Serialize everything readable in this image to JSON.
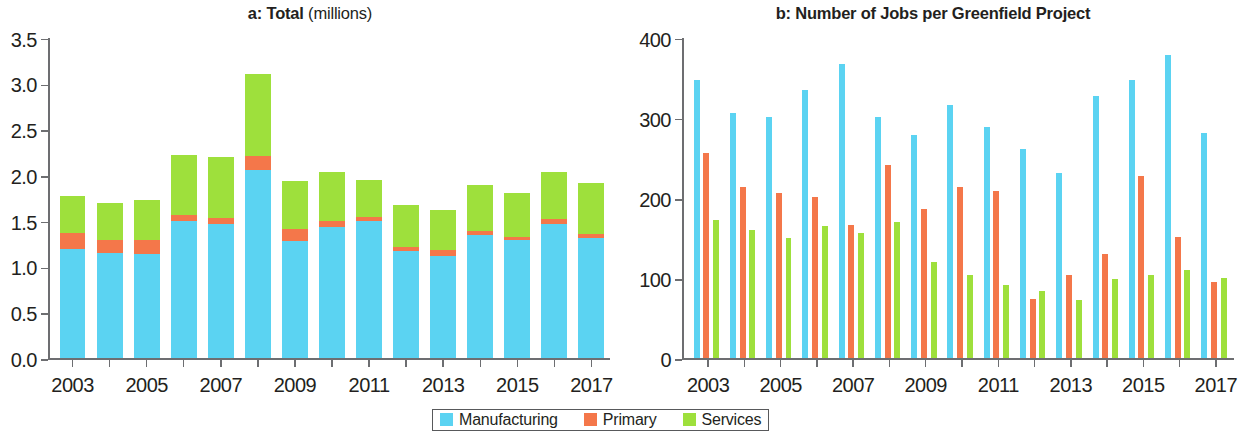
{
  "legend": {
    "entries": [
      {
        "label": "Manufacturing",
        "color": "#5BD3F2"
      },
      {
        "label": "Primary",
        "color": "#F4774A"
      },
      {
        "label": "Services",
        "color": "#9EE03C"
      }
    ]
  },
  "colors": {
    "manufacturing": "#5BD3F2",
    "primary": "#F4774A",
    "services": "#9EE03C",
    "axis": "#6D6E71",
    "text": "#231F20"
  },
  "panel_a": {
    "title_bold": "a: Total",
    "title_regular": "(millions)"
  },
  "panel_b": {
    "title_bold": "b: Number of Jobs per Greenfield Project",
    "title_regular": ""
  },
  "chart_data": [
    {
      "id": "panel-a",
      "type": "bar",
      "stacked": true,
      "title": "a: Total (millions)",
      "xlabel": "",
      "ylabel": "",
      "ylim": [
        0,
        3.5
      ],
      "yticks": [
        0,
        0.5,
        1.0,
        1.5,
        2.0,
        2.5,
        3.0,
        3.5
      ],
      "ytick_labels": [
        "0.0",
        "0.5",
        "1.0",
        "1.5",
        "2.0",
        "2.5",
        "3.0",
        "3.5"
      ],
      "grid": false,
      "legend_position": "bottom-center",
      "categories": [
        "2003",
        "2004",
        "2005",
        "2006",
        "2007",
        "2008",
        "2009",
        "2010",
        "2011",
        "2012",
        "2013",
        "2014",
        "2015",
        "2016",
        "2017"
      ],
      "xtick_labels_shown": [
        "2003",
        "2005",
        "2007",
        "2009",
        "2011",
        "2013",
        "2015",
        "2017"
      ],
      "series": [
        {
          "name": "Manufacturing",
          "color": "#5BD3F2",
          "values": [
            1.2,
            1.15,
            1.14,
            1.5,
            1.47,
            2.06,
            1.28,
            1.44,
            1.5,
            1.17,
            1.12,
            1.35,
            1.29,
            1.47,
            1.32
          ]
        },
        {
          "name": "Primary",
          "color": "#F4774A",
          "values": [
            0.17,
            0.14,
            0.15,
            0.07,
            0.06,
            0.15,
            0.13,
            0.06,
            0.05,
            0.05,
            0.06,
            0.04,
            0.04,
            0.05,
            0.04
          ]
        },
        {
          "name": "Services",
          "color": "#9EE03C",
          "values": [
            0.4,
            0.41,
            0.44,
            0.65,
            0.67,
            0.9,
            0.53,
            0.54,
            0.4,
            0.46,
            0.44,
            0.51,
            0.48,
            0.52,
            0.56
          ]
        }
      ],
      "totals": [
        1.77,
        1.7,
        1.73,
        2.22,
        2.2,
        3.11,
        1.94,
        2.04,
        1.95,
        1.68,
        1.62,
        1.9,
        1.81,
        2.04,
        1.92
      ]
    },
    {
      "id": "panel-b",
      "type": "bar",
      "stacked": false,
      "grouped": true,
      "title": "b: Number of Jobs per Greenfield Project",
      "xlabel": "",
      "ylabel": "",
      "ylim": [
        0,
        400
      ],
      "yticks": [
        0,
        100,
        200,
        300,
        400
      ],
      "ytick_labels": [
        "0",
        "100",
        "200",
        "300",
        "400"
      ],
      "grid": false,
      "legend_position": "bottom-center",
      "categories": [
        "2003",
        "2004",
        "2005",
        "2006",
        "2007",
        "2008",
        "2009",
        "2010",
        "2011",
        "2012",
        "2013",
        "2014",
        "2015",
        "2016",
        "2017"
      ],
      "xtick_labels_shown": [
        "2003",
        "2005",
        "2007",
        "2009",
        "2011",
        "2013",
        "2015",
        "2017"
      ],
      "series": [
        {
          "name": "Manufacturing",
          "color": "#5BD3F2",
          "values": [
            348,
            306,
            302,
            335,
            367,
            302,
            279,
            317,
            289,
            261,
            231,
            328,
            348,
            379,
            282
          ]
        },
        {
          "name": "Primary",
          "color": "#F4774A",
          "values": [
            257,
            214,
            206,
            202,
            166,
            242,
            186,
            214,
            209,
            74,
            104,
            130,
            228,
            152,
            96
          ]
        },
        {
          "name": "Services",
          "color": "#9EE03C",
          "values": [
            173,
            160,
            150,
            165,
            157,
            170,
            120,
            104,
            92,
            84,
            73,
            99,
            104,
            111,
            100
          ]
        }
      ]
    }
  ]
}
